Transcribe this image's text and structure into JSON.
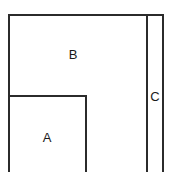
{
  "diagram": {
    "type": "nested-rectangles",
    "regions": [
      {
        "id": "A",
        "label": "A"
      },
      {
        "id": "B",
        "label": "B"
      },
      {
        "id": "C",
        "label": "C"
      }
    ],
    "stroke_color": "#2b2b2b",
    "background_color": "#ffffff"
  }
}
